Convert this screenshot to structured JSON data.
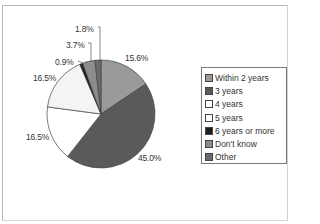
{
  "chart_data": {
    "type": "pie",
    "title": "",
    "categories": [
      "Within 2 years",
      "3 years",
      "4 years",
      "5 years",
      "6 years or more",
      "Don't know",
      "Other"
    ],
    "values": [
      15.6,
      45.0,
      16.5,
      16.5,
      0.9,
      3.7,
      1.8
    ],
    "value_labels": [
      "15.6%",
      "45.0%",
      "16.5%",
      "16.5%",
      "0.9%",
      "3.7%",
      "1.8%"
    ],
    "colors": [
      "#9a9a9a",
      "#5a5a5a",
      "#ffffff",
      "#f4f4f4",
      "#1e1e1e",
      "#8c8c8c",
      "#6a6a6a"
    ],
    "start_angle_deg": 0,
    "direction": "clockwise",
    "legend_position": "right"
  },
  "legend": {
    "items": [
      {
        "label": "Within 2 years",
        "color": "#9a9a9a"
      },
      {
        "label": "3 years",
        "color": "#5a5a5a"
      },
      {
        "label": "4 years",
        "color": "#ffffff"
      },
      {
        "label": "5 years",
        "color": "#ffffff"
      },
      {
        "label": "6 years or more",
        "color": "#1e1e1e"
      },
      {
        "label": "Don't know",
        "color": "#8c8c8c"
      },
      {
        "label": "Other",
        "color": "#6a6a6a"
      }
    ]
  },
  "labels": {
    "within2": "15.6%",
    "y3": "45.0%",
    "y4": "16.5%",
    "y5": "16.5%",
    "y6": "0.9%",
    "dontknow": "3.7%",
    "other": "1.8%"
  }
}
